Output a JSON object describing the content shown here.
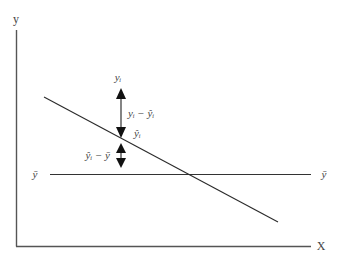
{
  "diagram": {
    "type": "regression-deviation-decomposition",
    "axes": {
      "y_label": "y",
      "x_label": "X"
    },
    "mean_line": {
      "left_label": "ȳ",
      "right_label": "ȳ"
    },
    "regression_line": {
      "start": [
        44,
        97
      ],
      "end": [
        278,
        222
      ]
    },
    "annotations": {
      "observed_point_label": "yᵢ",
      "fitted_point_label": "ŷᵢ",
      "residual_label": "yᵢ − ŷᵢ",
      "explained_label": "ŷᵢ − ȳ"
    },
    "colors": {
      "axis": "#555555",
      "lines": "#2a2a2a",
      "arrowheads": "#111111",
      "text": "#444444"
    }
  }
}
